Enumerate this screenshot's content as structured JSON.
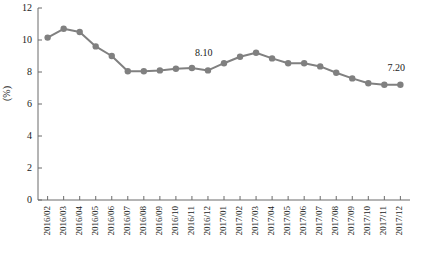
{
  "chart_data": {
    "type": "line",
    "title": "",
    "xlabel": "",
    "ylabel": "(%)",
    "ylim": [
      0,
      12
    ],
    "yticks": [
      0,
      2,
      4,
      6,
      8,
      10,
      12
    ],
    "ytick_labels": [
      "0",
      "2",
      "4",
      "6",
      "8",
      "10",
      "12"
    ],
    "grid": false,
    "legend": "none",
    "marker": "circle",
    "series_color": "#808080",
    "categories": [
      "2016/02",
      "2016/03",
      "2016/04",
      "2016/05",
      "2016/06",
      "2016/07",
      "2016/08",
      "2016/09",
      "2016/10",
      "2016/11",
      "2016/12",
      "2017/01",
      "2017/02",
      "2017/03",
      "2017/04",
      "2017/05",
      "2017/06",
      "2017/07",
      "2017/08",
      "2017/09",
      "2017/10",
      "2017/11",
      "2017/12"
    ],
    "series": [
      {
        "name": "",
        "values": [
          10.15,
          10.7,
          10.5,
          9.6,
          9.0,
          8.05,
          8.05,
          8.1,
          8.2,
          8.25,
          8.1,
          8.55,
          8.95,
          9.2,
          8.85,
          8.55,
          8.55,
          8.35,
          7.95,
          7.6,
          7.3,
          7.2,
          7.2
        ]
      }
    ],
    "annotations": [
      {
        "text": "8.10",
        "category": "2016/12",
        "value": 8.1
      },
      {
        "text": "7.20",
        "category": "2017/12",
        "value": 7.2
      }
    ]
  }
}
